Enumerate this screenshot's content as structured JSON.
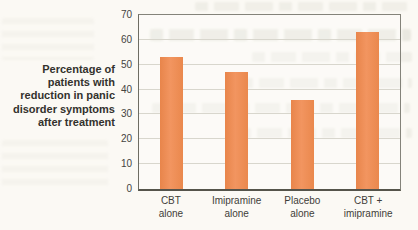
{
  "figure_type": "scanned-textbook-bar-chart",
  "chart_data": {
    "type": "bar",
    "title": "",
    "xlabel": "",
    "ylabel": "Percentage of patients with reduction in panic disorder symptoms after treatment",
    "ylabel_lines": [
      "Percentage of",
      "patients with",
      "reduction in panic",
      "disorder symptoms",
      "after treatment"
    ],
    "categories": [
      "CBT alone",
      "Imipramine alone",
      "Placebo alone",
      "CBT + imipramine"
    ],
    "category_lines": [
      [
        "CBT",
        "alone"
      ],
      [
        "Imipramine",
        "alone"
      ],
      [
        "Placebo",
        "alone"
      ],
      [
        "CBT +",
        "imipramine"
      ]
    ],
    "values": [
      53,
      47,
      36,
      63
    ],
    "ylim": [
      0,
      70
    ],
    "yticks": [
      0,
      10,
      20,
      30,
      40,
      50,
      60,
      70
    ],
    "grid": true,
    "legend_position": "none",
    "bar_color": "#ee8c55",
    "gridline_color": "#d8d6cd",
    "axis_color": "#55544b"
  }
}
